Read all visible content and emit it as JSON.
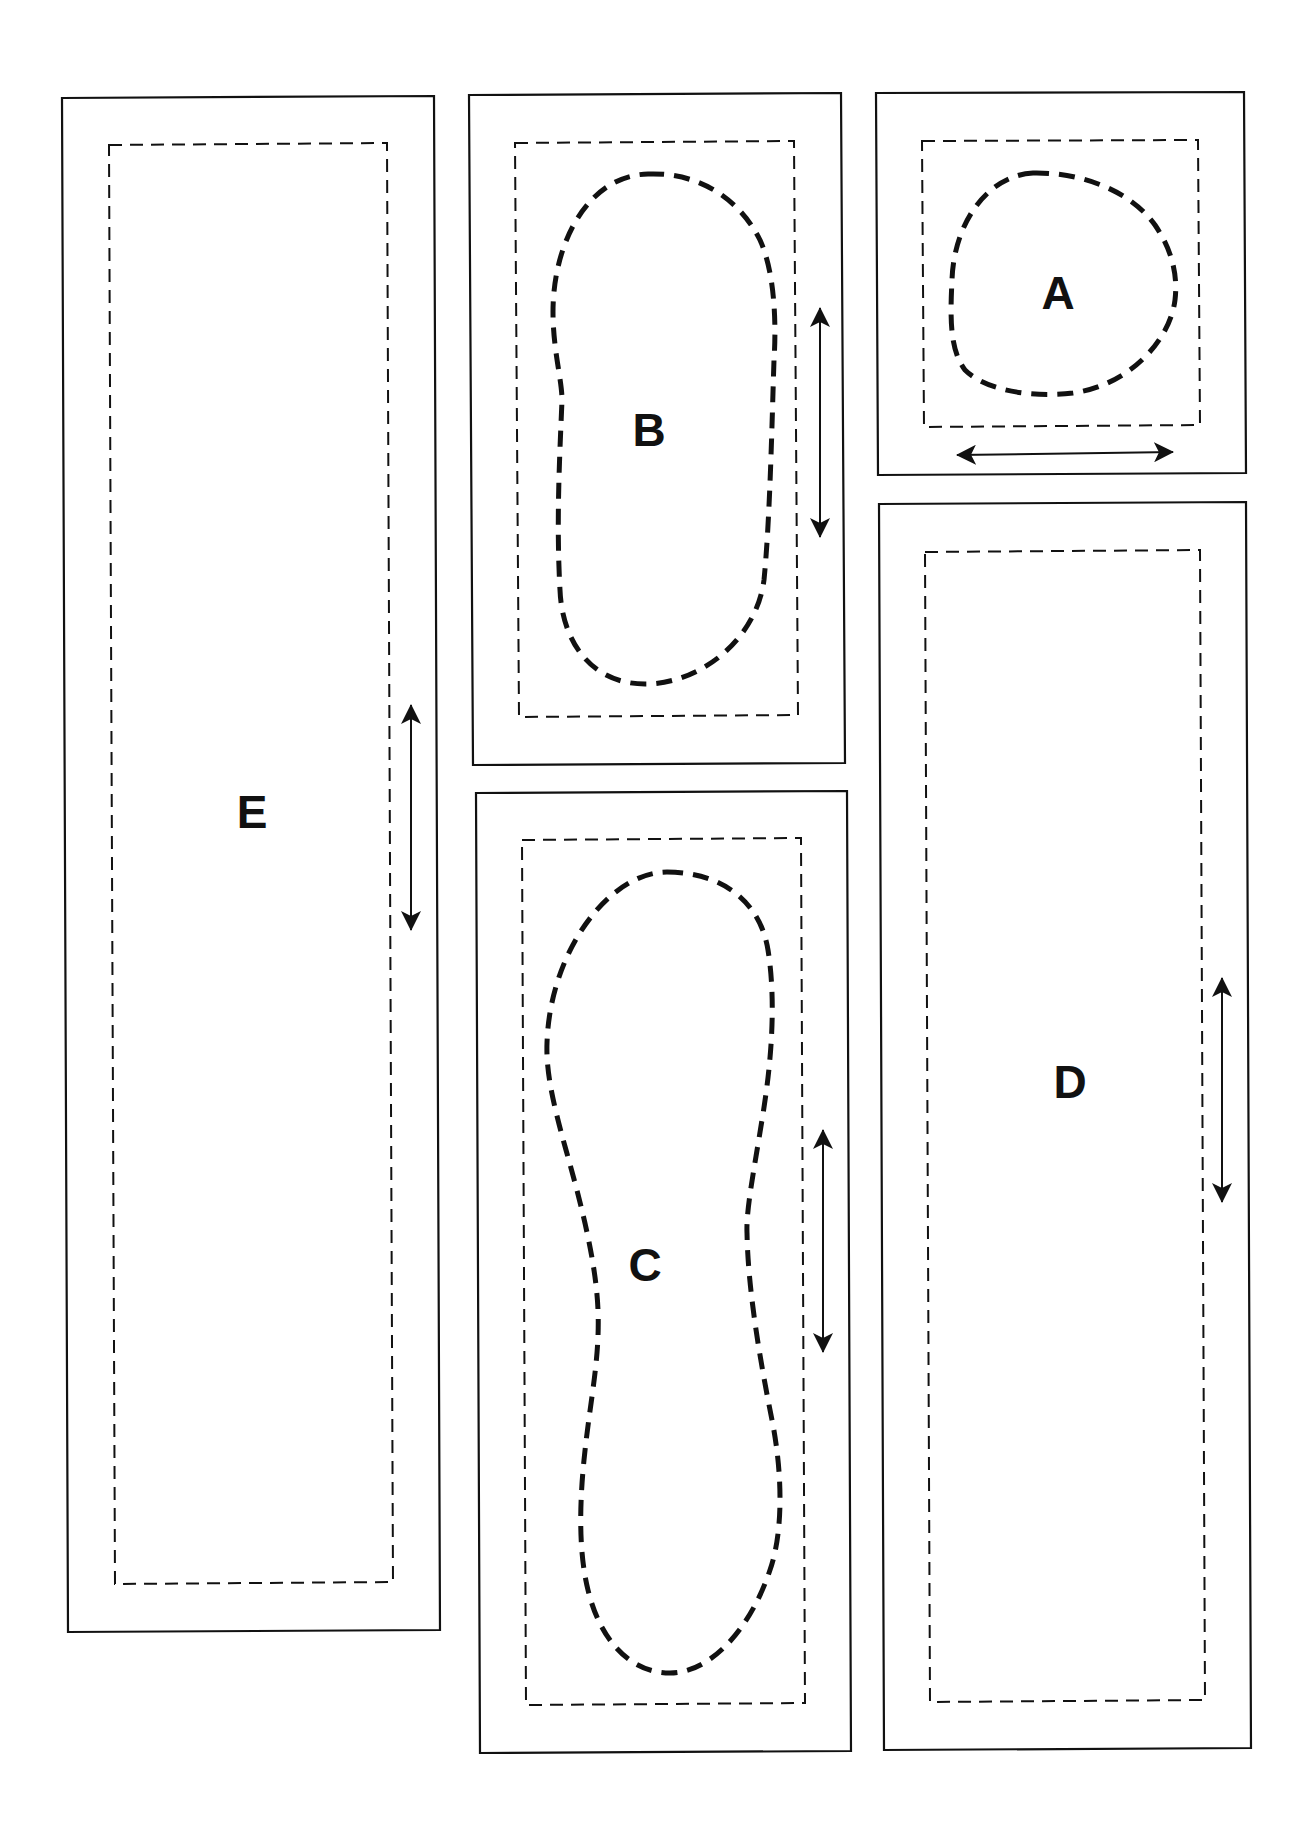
{
  "pieces": [
    {
      "id": "E",
      "label": "E",
      "grain_arrow": "vertical",
      "has_cutout": false
    },
    {
      "id": "B",
      "label": "B",
      "grain_arrow": "vertical",
      "has_cutout": true
    },
    {
      "id": "A",
      "label": "A",
      "grain_arrow": "horizontal",
      "has_cutout": true
    },
    {
      "id": "C",
      "label": "C",
      "grain_arrow": "vertical",
      "has_cutout": true
    },
    {
      "id": "D",
      "label": "D",
      "grain_arrow": "vertical",
      "has_cutout": false
    }
  ],
  "colors": {
    "line": "#111111",
    "background": "#ffffff"
  }
}
